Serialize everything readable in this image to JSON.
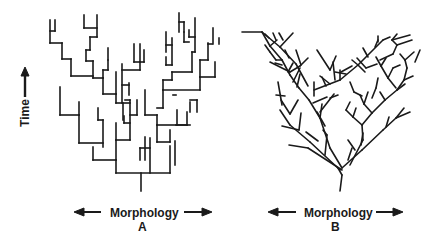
{
  "figure": {
    "y_axis_label": "Time",
    "panels": [
      {
        "id": "A",
        "letter": "A",
        "x_axis_label": "Morphology",
        "style": "rectangular-cladogram"
      },
      {
        "id": "B",
        "letter": "B",
        "x_axis_label": "Morphology",
        "style": "diagonal-branching-tree"
      }
    ],
    "colors": {
      "line": "#1a1a1a",
      "background": "#ffffff"
    }
  }
}
